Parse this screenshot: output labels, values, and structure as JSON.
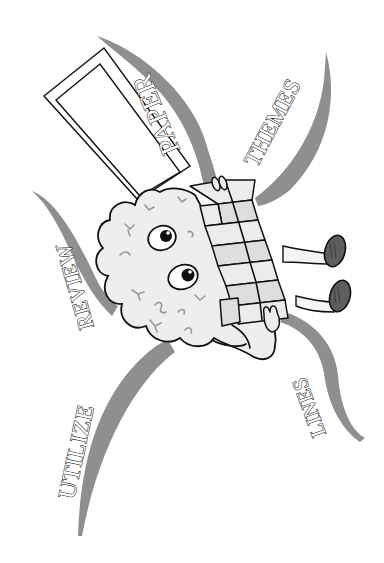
{
  "illustration": {
    "description": "Cartoon brain character carrying a folded paper stack, surrounded by curved ribbons with words",
    "colors": {
      "background": "#ffffff",
      "ribbon": "#8f8f8f",
      "brain_fill": "#eeeeee",
      "brain_folds": "#9a9a9a",
      "paper_stack": "#dedede",
      "shoes": "#5e5e5e",
      "outline": "#111111"
    },
    "labels": {
      "paper": "PAPER",
      "themes": "THEMES",
      "review": "REVIEW",
      "utilize": "UTILIZE",
      "lines": "LINES"
    }
  }
}
